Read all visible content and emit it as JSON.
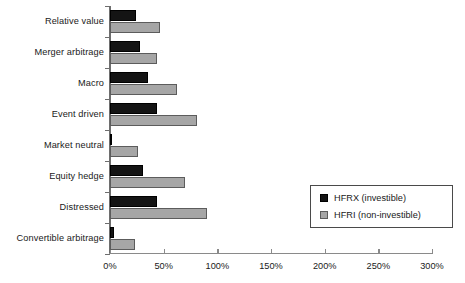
{
  "chart_data": {
    "type": "bar",
    "orientation": "horizontal",
    "title": "",
    "xlabel": "",
    "ylabel": "",
    "categories": [
      "Relative value",
      "Merger arbitrage",
      "Macro",
      "Event driven",
      "Market neutral",
      "Equity hedge",
      "Distressed",
      "Convertible arbitrage"
    ],
    "series": [
      {
        "name": "HFRX (investible)",
        "color": "#141414",
        "values": [
          24,
          28,
          35,
          44,
          2,
          31,
          44,
          4
        ]
      },
      {
        "name": "HFRI (non-investible)",
        "color": "#a6a6a6",
        "values": [
          47,
          44,
          62,
          81,
          26,
          70,
          90,
          23
        ]
      }
    ],
    "xlim": [
      0,
      300
    ],
    "xticks": [
      0,
      50,
      100,
      150,
      200,
      250,
      300
    ],
    "xtick_labels": [
      "0%",
      "50%",
      "100%",
      "150%",
      "200%",
      "250%",
      "300%"
    ],
    "grid": false,
    "legend_position": "middle-right"
  },
  "legend": {
    "entries": [
      {
        "label": "HFRX (investible)",
        "swatch": "hfrx"
      },
      {
        "label": "HFRI (non-investible)",
        "swatch": "hfri"
      }
    ]
  }
}
